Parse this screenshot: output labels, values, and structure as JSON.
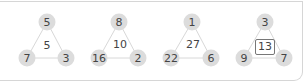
{
  "puzzles": [
    {
      "top": "5",
      "left": "7",
      "right": "3",
      "center": "5"
    },
    {
      "top": "8",
      "left": "16",
      "right": "2",
      "center": "10"
    },
    {
      "top": "1",
      "left": "22",
      "right": "6",
      "center": "27"
    },
    {
      "top": "3",
      "left": "9",
      "right": "7",
      "center": "13"
    }
  ],
  "colors": {
    "node_fill": "#dcdcdc",
    "edge": "#d8d8d8",
    "text": "#444444",
    "frame": "#d6d6d6"
  }
}
